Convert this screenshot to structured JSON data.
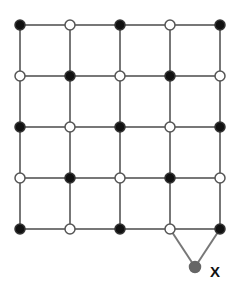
{
  "diagram": {
    "type": "grid-graph",
    "rows": 5,
    "cols": 5,
    "grid_origin": [
      20,
      25
    ],
    "spacing": [
      50,
      51
    ],
    "colors": {
      "edge": "#777777",
      "black_node": "#111111",
      "white_node": "#ffffff",
      "node_stroke": "#555555",
      "extra_node": "#666666"
    },
    "node_pattern": [
      [
        "black",
        "white",
        "black",
        "white",
        "black"
      ],
      [
        "white",
        "black",
        "white",
        "black",
        "white"
      ],
      [
        "black",
        "white",
        "black",
        "white",
        "black"
      ],
      [
        "white",
        "black",
        "white",
        "black",
        "white"
      ],
      [
        "black",
        "white",
        "black",
        "white",
        "black"
      ]
    ],
    "extra_node": {
      "label": "X",
      "position": [
        195,
        267
      ],
      "connected_to": [
        [
          4,
          3
        ],
        [
          4,
          4
        ]
      ]
    }
  }
}
